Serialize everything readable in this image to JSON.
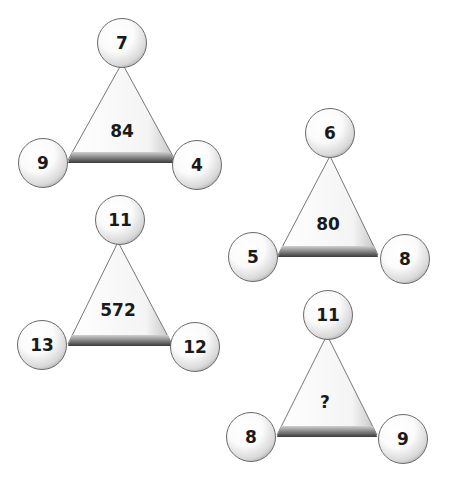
{
  "puzzles": [
    {
      "top": "7",
      "left": "9",
      "right": "4",
      "center": "84"
    },
    {
      "top": "6",
      "left": "5",
      "right": "8",
      "center": "80"
    },
    {
      "top": "11",
      "left": "13",
      "right": "12",
      "center": "572"
    },
    {
      "top": "11",
      "left": "8",
      "right": "9",
      "center": "?"
    }
  ]
}
